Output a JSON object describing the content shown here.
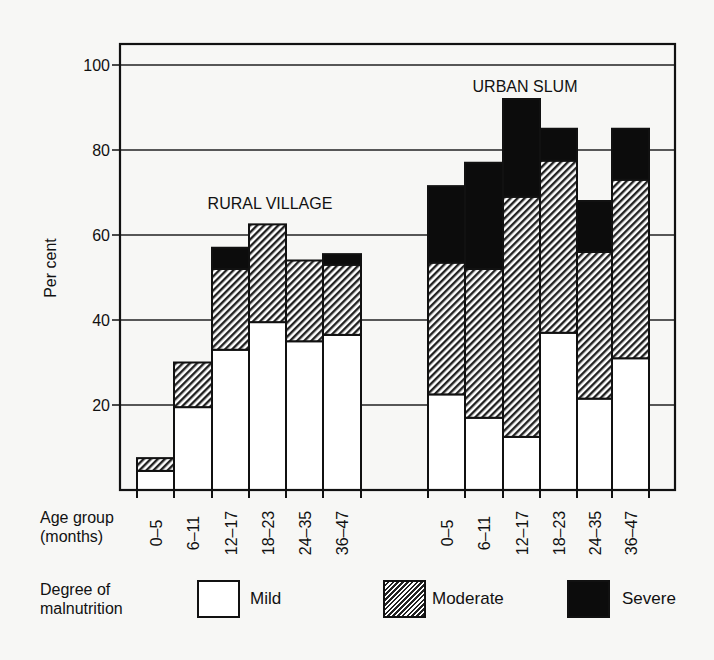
{
  "chart_data": {
    "type": "bar",
    "stacked": true,
    "title": "",
    "ylabel": "Per cent",
    "xlabel": "Age group (months)",
    "ylim": [
      0,
      105
    ],
    "yticks": [
      20,
      40,
      60,
      80,
      100
    ],
    "grid": true,
    "groups": [
      {
        "name": "RURAL VILLAGE",
        "categories": [
          "0–5",
          "6–11",
          "12–17",
          "18–23",
          "24–35",
          "36–47"
        ],
        "series": [
          {
            "name": "Mild",
            "values": [
              4.5,
              19.5,
              33,
              39.5,
              35,
              36.5
            ]
          },
          {
            "name": "Moderate",
            "values": [
              3,
              10.5,
              19,
              23,
              19,
              16.5
            ]
          },
          {
            "name": "Severe",
            "values": [
              0,
              0,
              5,
              0,
              0,
              2.5
            ]
          }
        ],
        "totals": [
          7.5,
          30,
          57,
          62.5,
          54,
          55.5
        ]
      },
      {
        "name": "URBAN SLUM",
        "categories": [
          "0–5",
          "6–11",
          "12–17",
          "18–23",
          "24–35",
          "36–47"
        ],
        "series": [
          {
            "name": "Mild",
            "values": [
              22.5,
              17,
              12.5,
              37,
              21.5,
              31
            ]
          },
          {
            "name": "Moderate",
            "values": [
              31,
              35,
              56.5,
              40.5,
              34.5,
              42
            ]
          },
          {
            "name": "Severe",
            "values": [
              18,
              25,
              23,
              7.5,
              12,
              12
            ]
          }
        ],
        "totals": [
          71.5,
          77,
          92,
          85,
          68,
          85
        ]
      }
    ],
    "legend": {
      "title": "Degree of malnutrition",
      "position": "bottom",
      "entries": [
        {
          "name": "Mild",
          "fill": "white"
        },
        {
          "name": "Moderate",
          "fill": "hatched"
        },
        {
          "name": "Severe",
          "fill": "black"
        }
      ]
    }
  },
  "labels": {
    "ylabel": "Per cent",
    "xlabel_line1": "Age group",
    "xlabel_line2": "(months)",
    "rural_title": "RURAL VILLAGE",
    "urban_title": "URBAN SLUM",
    "legend_title_line1": "Degree of",
    "legend_title_line2": "malnutrition",
    "legend_mild": "Mild",
    "legend_moderate": "Moderate",
    "legend_severe": "Severe"
  },
  "colors": {
    "ink": "#111111",
    "paper": "#f7f7f5",
    "mild": "#ffffff",
    "severe": "#0c0c0c"
  }
}
